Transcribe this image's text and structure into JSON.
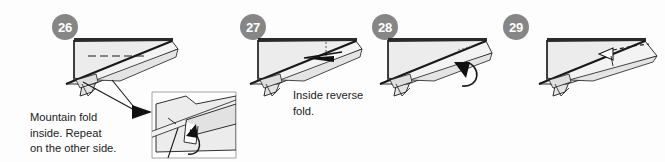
{
  "document": {
    "type": "origami-instruction-diagram",
    "title": "Paper airplane folding steps 26-29",
    "background_color": "#fdfdfd"
  },
  "style": {
    "badge_fill": "#868686",
    "badge_text_color": "#ffffff",
    "paper_fill": "#e9e9e9",
    "paper_fill_light": "#f2f2f2",
    "paper_fill_shade": "#d8d8d8",
    "outline_color": "#1a1a1a",
    "text_color": "#1b1b1b"
  },
  "panels": [
    {
      "id": "panel-26",
      "step_number": "26",
      "badge_x": 52,
      "badge_y": 14,
      "caption": "Mountain fold\ninside. Repeat\non the other side.",
      "caption_x": 30,
      "caption_y": 110,
      "fold_line_style": "dashed",
      "fold_type": "mountain-fold",
      "has_detail_inset": true,
      "annotations": [
        "dashed-mountain-fold-line",
        "leader-arrow-to-inset",
        "curved-fold-arrow"
      ]
    },
    {
      "id": "panel-27",
      "step_number": "27",
      "badge_x": 240,
      "badge_y": 14,
      "caption": "Inside reverse\nfold.",
      "caption_x": 293,
      "caption_y": 88,
      "fold_line_style": "dotted",
      "fold_type": "inside-reverse-fold",
      "has_detail_inset": false,
      "annotations": [
        "solid-arrowhead-left",
        "vertical-dotted-guide"
      ]
    },
    {
      "id": "panel-28",
      "step_number": "28",
      "badge_x": 372,
      "badge_y": 14,
      "caption": "",
      "caption_x": 0,
      "caption_y": 0,
      "fold_line_style": "dotted",
      "fold_type": "curl-fold",
      "has_detail_inset": false,
      "annotations": [
        "curved-hook-arrow"
      ]
    },
    {
      "id": "panel-29",
      "step_number": "29",
      "badge_x": 503,
      "badge_y": 14,
      "caption": "",
      "caption_x": 0,
      "caption_y": 0,
      "fold_line_style": "dashed",
      "fold_type": "open-out-fold",
      "has_detail_inset": false,
      "annotations": [
        "hollow-arrowhead",
        "dashed-guide-line"
      ]
    }
  ]
}
